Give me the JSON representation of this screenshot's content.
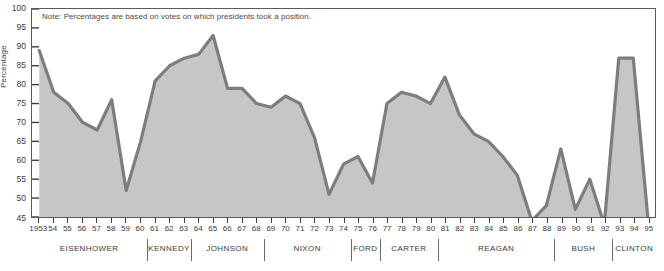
{
  "note": "Note: Percentages are based on votes on which presidents took a position.",
  "axes": {
    "ylabel": "Percentage",
    "yticks": [
      100,
      95,
      90,
      85,
      80,
      75,
      70,
      65,
      60,
      55,
      50,
      45
    ],
    "ylim": [
      45,
      100
    ],
    "xlabel": "",
    "xtick_labels": [
      "1953",
      "54",
      "55",
      "56",
      "57",
      "58",
      "59",
      "60",
      "61",
      "62",
      "63",
      "64",
      "65",
      "66",
      "67",
      "68",
      "69",
      "70",
      "71",
      "72",
      "73",
      "74",
      "75",
      "76",
      "77",
      "78",
      "79",
      "80",
      "81",
      "82",
      "83",
      "84",
      "85",
      "86",
      "87",
      "88",
      "89",
      "90",
      "91",
      "92",
      "93",
      "94",
      "95"
    ]
  },
  "presidents": [
    {
      "name": "EISENHOWER",
      "start": 1953,
      "end": 1960
    },
    {
      "name": "KENNEDY",
      "start": 1961,
      "end": 1963
    },
    {
      "name": "JOHNSON",
      "start": 1964,
      "end": 1968
    },
    {
      "name": "NIXON",
      "start": 1969,
      "end": 1974
    },
    {
      "name": "FORD",
      "start": 1975,
      "end": 1976
    },
    {
      "name": "CARTER",
      "start": 1977,
      "end": 1980
    },
    {
      "name": "REAGAN",
      "start": 1981,
      "end": 1988
    },
    {
      "name": "BUSH",
      "start": 1989,
      "end": 1992
    },
    {
      "name": "CLINTON",
      "start": 1993,
      "end": 1995
    }
  ],
  "colors": {
    "fill": "#c6c6c6",
    "line": "#7d7d7d",
    "frame": "#5a5a5a",
    "text": "#3c3c3c",
    "background": "#ffffff"
  },
  "chart_data": {
    "type": "area",
    "title": "",
    "xlabel": "",
    "ylabel": "Percentage",
    "ylim": [
      45,
      100
    ],
    "grid": false,
    "legend": "none",
    "x": [
      1953,
      1954,
      1955,
      1956,
      1957,
      1958,
      1959,
      1960,
      1961,
      1962,
      1963,
      1964,
      1965,
      1966,
      1967,
      1968,
      1969,
      1970,
      1971,
      1972,
      1973,
      1974,
      1975,
      1976,
      1977,
      1978,
      1979,
      1980,
      1981,
      1982,
      1983,
      1984,
      1985,
      1986,
      1987,
      1988,
      1989,
      1990,
      1991,
      1992,
      1993,
      1994,
      1995
    ],
    "values": [
      89,
      78,
      75,
      70,
      68,
      76,
      52,
      65,
      81,
      85,
      87,
      88,
      93,
      79,
      79,
      75,
      74,
      77,
      75,
      66,
      51,
      59,
      61,
      54,
      75,
      78,
      77,
      75,
      82,
      72,
      67,
      65,
      61,
      56,
      44,
      48,
      63,
      47,
      55,
      43,
      87,
      87,
      45
    ],
    "annotations": [
      "Note: Percentages are based on votes on which presidents took a position."
    ]
  }
}
